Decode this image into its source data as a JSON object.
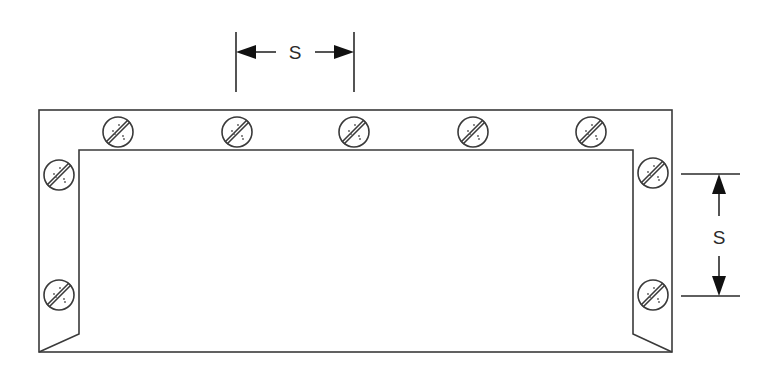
{
  "diagram": {
    "type": "fastener-spacing-diagram",
    "stroke_color": "#3a3a3a",
    "background": "#ffffff",
    "frame": {
      "outer": {
        "left": 39,
        "top": 110,
        "right": 672,
        "bottom": 352
      },
      "inner": {
        "left": 79,
        "top": 150,
        "right": 633,
        "bottom": 334
      }
    },
    "screws": {
      "icon": "slotted-screw-head-icon",
      "radius": 15,
      "top_row": [
        {
          "x": 118,
          "y": 132
        },
        {
          "x": 237,
          "y": 132
        },
        {
          "x": 354,
          "y": 132
        },
        {
          "x": 473,
          "y": 132
        },
        {
          "x": 591,
          "y": 132
        }
      ],
      "left_column": [
        {
          "x": 59,
          "y": 175
        },
        {
          "x": 59,
          "y": 295
        }
      ],
      "right_column": [
        {
          "x": 653,
          "y": 173
        },
        {
          "x": 653,
          "y": 295
        }
      ]
    },
    "dimensions": {
      "horizontal": {
        "label": "S",
        "x1": 236,
        "x2": 354,
        "y": 52,
        "ext_top": 32,
        "ext_bottom": 92
      },
      "vertical": {
        "label": "S",
        "y1": 174,
        "y2": 296,
        "x": 719,
        "ext_left": 681,
        "ext_right": 740
      }
    }
  }
}
